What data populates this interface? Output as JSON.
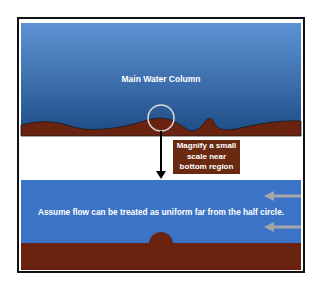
{
  "labels": {
    "main_water_column": "Main Water Column",
    "magnify_note_line1": "Magnify a small",
    "magnify_note_line2": "scale near",
    "magnify_note_line3": "bottom region",
    "uniform_flow_note": "Assume flow can be treated as uniform far from the half circle."
  },
  "colors": {
    "water_top": "#5a8fd0",
    "water_bottom": "#1f4f8a",
    "water_lower_panel": "#3b74c6",
    "sediment": "#6a2310",
    "label_box": "#6a2a12",
    "flow_arrow": "#a6a6a6",
    "frame": "#111111"
  },
  "icons": {
    "magnify_circle": "magnify-circle-icon",
    "down_arrow": "arrow-down-icon",
    "flow_arrows": "arrow-left-icon"
  }
}
